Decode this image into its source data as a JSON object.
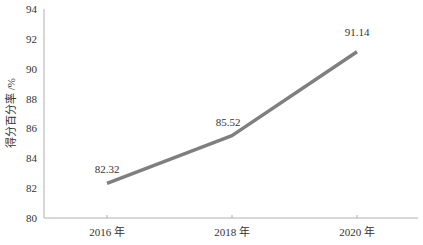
{
  "chart_data": {
    "type": "line",
    "title": "",
    "xlabel": "",
    "ylabel": "得分百分率 /%",
    "categories": [
      "2016 年",
      "2018 年",
      "2020 年"
    ],
    "series": [
      {
        "name": "得分百分率",
        "values": [
          82.32,
          85.52,
          91.14
        ],
        "color": "#7f7f7f"
      }
    ],
    "data_labels": [
      "82.32",
      "85.52",
      "91.14"
    ],
    "ylim": [
      80,
      94
    ],
    "yticks": [
      80,
      82,
      84,
      86,
      88,
      90,
      92,
      94
    ],
    "grid": false,
    "legend": "none"
  }
}
